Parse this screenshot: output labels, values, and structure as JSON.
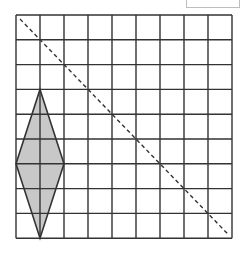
{
  "diagram": {
    "type": "grid-reflection",
    "grid": {
      "cols": 9,
      "rows": 9,
      "origin_px": [
        16,
        15
      ],
      "cell_w": 24,
      "cell_h": 24.8,
      "line_color": "#333333"
    },
    "shape": {
      "name": "rhombus",
      "vertices_grid": [
        [
          1,
          3
        ],
        [
          2,
          6
        ],
        [
          1,
          9
        ],
        [
          0,
          6
        ]
      ],
      "fill": "#c8c8c8",
      "stroke": "#333333"
    },
    "mirror_line": {
      "from_grid": [
        0,
        0
      ],
      "to_grid": [
        9,
        9
      ],
      "style": "dashed",
      "color": "#333333"
    },
    "answer_box": {
      "visible": true
    }
  }
}
